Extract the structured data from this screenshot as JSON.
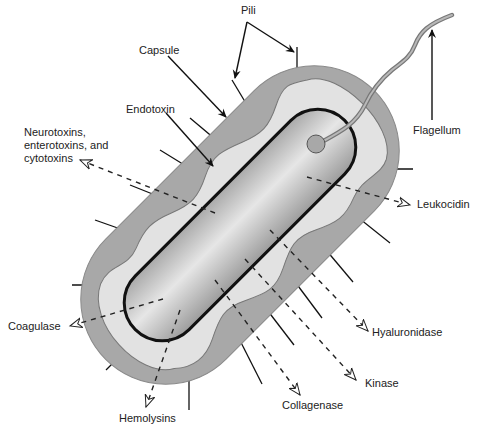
{
  "diagram": {
    "colors": {
      "capsule": "#a8a8a8",
      "slime_layer": "#e2e2e2",
      "cell_body": "#c8c8c8",
      "outline": "#111111",
      "background": "#ffffff"
    },
    "structure_labels": {
      "pili": "Pili",
      "capsule": "Capsule",
      "endotoxin": "Endotoxin",
      "flagellum": "Flagellum"
    },
    "secreted_factors": {
      "neurotoxins": "Neurotoxins,\nenterotoxins, and\ncytotoxins",
      "leukocidin": "Leukocidin",
      "coagulase": "Coagulase",
      "hyaluronidase": "Hyaluronidase",
      "kinase": "Kinase",
      "hemolysins": "Hemolysins",
      "collagenase": "Collagenase"
    }
  }
}
